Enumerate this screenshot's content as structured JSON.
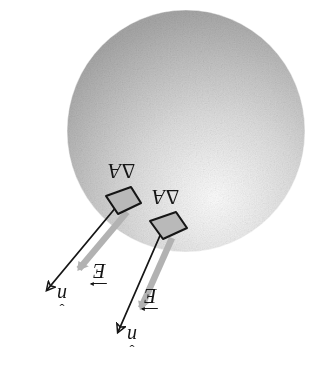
{
  "figure": {
    "type": "physics-diagram",
    "background_color": "#ffffff",
    "width": 327,
    "height": 366,
    "rotation_note": "All labels are rendered rotated 180 degrees (upside down) as in the original scan.",
    "sphere": {
      "name": "shaded-sphere",
      "center_x": 186,
      "center_y": 131,
      "radius_x": 119,
      "radius_y": 121,
      "fill_light": "#fdfdfd",
      "fill_mid": "#d0d0d0",
      "fill_dark": "#a2a2a2",
      "highlight_x": "62%",
      "highlight_y": "78%"
    },
    "colors": {
      "ink": "#161616",
      "patch_fill": "#b9b9b9",
      "patch_stroke": "#161616",
      "field_arrow": "#b4b4b4",
      "sphere_shade": "#c4c4c4"
    },
    "patches": [
      {
        "name": "area-patch-1",
        "label": "ΔA",
        "delta": "Δ",
        "area": "A",
        "cx": 121,
        "cy": 203
      },
      {
        "name": "area-patch-2",
        "label": "ΔA",
        "delta": "Δ",
        "area": "A",
        "cx": 166,
        "cy": 228
      }
    ],
    "normal_vectors": [
      {
        "name": "normal-vector-1",
        "label": "n",
        "hat": "ˇ",
        "from_x": 117,
        "from_y": 206,
        "to_x": 45,
        "to_y": 293
      },
      {
        "name": "normal-vector-2",
        "label": "n",
        "hat": "ˇ",
        "from_x": 162,
        "from_y": 231,
        "to_x": 116,
        "to_y": 336
      }
    ],
    "field_vectors": [
      {
        "name": "electric-field-vector-1",
        "label": "E",
        "from_x": 127,
        "from_y": 212,
        "to_x": 77,
        "to_y": 272
      },
      {
        "name": "electric-field-vector-2",
        "label": "E",
        "from_x": 172,
        "from_y": 238,
        "to_x": 139,
        "to_y": 312
      }
    ],
    "labels": {
      "delta_a_1": "ΔA",
      "delta_a_2": "ΔA",
      "e_1": "E",
      "e_2": "E",
      "n_1": "n",
      "n_2": "n"
    }
  }
}
